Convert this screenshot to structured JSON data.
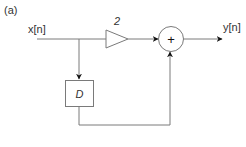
{
  "figure": {
    "panel_label": "(a)",
    "input_label": "x[n]",
    "output_label": "y[n]",
    "gain_label": "2",
    "delay_label": "D",
    "adder_symbol": "+"
  },
  "colors": {
    "line": "#7a7a7a",
    "arrow": "#111111",
    "text": "#333333",
    "background": "#ffffff"
  }
}
